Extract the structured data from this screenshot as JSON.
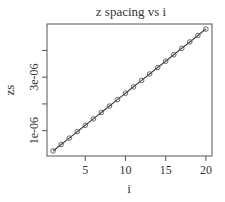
{
  "chart_data": {
    "type": "line",
    "title": "z spacing vs i",
    "xlabel": "i",
    "ylabel": "zs",
    "x": [
      1,
      2,
      3,
      4,
      5,
      6,
      7,
      8,
      9,
      10,
      11,
      12,
      13,
      14,
      15,
      16,
      17,
      18,
      19,
      20
    ],
    "series": [
      {
        "name": "zs",
        "values": [
          2.4e-07,
          4.8e-07,
          7.2e-07,
          9.6e-07,
          1.2e-06,
          1.44e-06,
          1.68e-06,
          1.92e-06,
          2.16e-06,
          2.4e-06,
          2.64e-06,
          2.88e-06,
          3.12e-06,
          3.36e-06,
          3.6e-06,
          3.84e-06,
          4.08e-06,
          4.32e-06,
          4.56e-06,
          4.8e-06
        ],
        "marker": "open-circle",
        "line": true
      }
    ],
    "xticks": [
      5,
      10,
      15,
      20
    ],
    "xtick_labels": [
      "5",
      "10",
      "15",
      "20"
    ],
    "yticks": [
      1e-06,
      2e-06,
      3e-06,
      4e-06
    ],
    "ytick_labels": [
      "1e-06",
      "",
      "3e-06",
      ""
    ],
    "xlim": [
      0.24,
      20.76
    ],
    "ylim": [
      5.2e-08,
      4.99e-06
    ],
    "grid": false,
    "legend": null
  },
  "colors": {
    "axis": "#555555",
    "line": "#444444",
    "marker": "#555555"
  }
}
